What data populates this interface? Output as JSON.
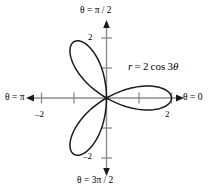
{
  "figure": {
    "background_color": "#ffffff",
    "curve_color": "#1a1a1a",
    "axis_color": "#8c8c8c",
    "text_color": "#000000"
  },
  "labels": {
    "theta_pi_over_2": "θ = π / 2",
    "theta_3pi_over_2": "θ = 3π / 2",
    "theta_pi": "θ = π",
    "theta_0": "θ = 0",
    "equation": "r = 2 cos 3θ",
    "equation_parts": {
      "r": "r",
      "equals": "=",
      "coefficient": "2",
      "function": "cos",
      "multiple": "3",
      "theta": "θ"
    }
  },
  "ticks": {
    "x_neg2": "–2",
    "x_pos2": "2",
    "y_pos2": "2",
    "y_neg2": "–2"
  },
  "chart_data": {
    "type": "line",
    "plot_kind": "polar-rose",
    "title": "",
    "equation": "r = 2 cos 3θ",
    "xlabel": "θ = 0",
    "ylabel": "θ = π / 2",
    "xlim": [
      -2.6,
      2.6
    ],
    "ylim": [
      -2.6,
      2.6
    ],
    "xticks": [
      -2,
      -1,
      1,
      2
    ],
    "yticks": [
      -2,
      -1,
      1,
      2
    ],
    "xtick_labels": [
      "–2",
      "",
      "",
      "2"
    ],
    "ytick_labels": [
      "–2",
      "",
      "",
      "2"
    ],
    "grid": false,
    "legend": false,
    "axis_arrows": [
      "left",
      "right",
      "up",
      "down"
    ],
    "angle_labels": [
      {
        "angle_deg": 0,
        "text": "θ = 0",
        "position": "right"
      },
      {
        "angle_deg": 90,
        "text": "θ = π / 2",
        "position": "top"
      },
      {
        "angle_deg": 180,
        "text": "θ = π",
        "position": "left"
      },
      {
        "angle_deg": 270,
        "text": "θ = 3π / 2",
        "position": "bottom"
      }
    ],
    "polar": {
      "r_function": "2*cos(3*theta)",
      "amplitude": 2,
      "petal_count": 3,
      "max_radius": 2,
      "petal_axis_angles_deg": [
        0,
        120,
        240
      ],
      "petal_half_width_deg": 30,
      "theta_range_deg": [
        0,
        360
      ],
      "sample_step_deg": 1
    },
    "series": [
      {
        "name": "r = 2 cos 3θ",
        "color": "#1a1a1a",
        "points_polar_deg": [
          {
            "theta": 0,
            "r": 2.0
          },
          {
            "theta": 10,
            "r": 1.732
          },
          {
            "theta": 20,
            "r": 1.0
          },
          {
            "theta": 30,
            "r": 0.0
          },
          {
            "theta": 40,
            "r": -1.0
          },
          {
            "theta": 50,
            "r": -1.732
          },
          {
            "theta": 60,
            "r": -2.0
          },
          {
            "theta": 70,
            "r": -1.732
          },
          {
            "theta": 80,
            "r": -1.0
          },
          {
            "theta": 90,
            "r": 0.0
          },
          {
            "theta": 100,
            "r": 1.0
          },
          {
            "theta": 110,
            "r": 1.732
          },
          {
            "theta": 120,
            "r": 2.0
          },
          {
            "theta": 130,
            "r": 1.732
          },
          {
            "theta": 140,
            "r": 1.0
          },
          {
            "theta": 150,
            "r": 0.0
          },
          {
            "theta": 160,
            "r": -1.0
          },
          {
            "theta": 170,
            "r": -1.732
          },
          {
            "theta": 180,
            "r": -2.0
          },
          {
            "theta": 190,
            "r": -1.732
          },
          {
            "theta": 200,
            "r": -1.0
          },
          {
            "theta": 210,
            "r": 0.0
          },
          {
            "theta": 220,
            "r": 1.0
          },
          {
            "theta": 230,
            "r": 1.732
          },
          {
            "theta": 240,
            "r": 2.0
          },
          {
            "theta": 250,
            "r": 1.732
          },
          {
            "theta": 260,
            "r": 1.0
          },
          {
            "theta": 270,
            "r": 0.0
          },
          {
            "theta": 280,
            "r": -1.0
          },
          {
            "theta": 290,
            "r": -1.732
          },
          {
            "theta": 300,
            "r": -2.0
          },
          {
            "theta": 310,
            "r": -1.732
          },
          {
            "theta": 320,
            "r": -1.0
          },
          {
            "theta": 330,
            "r": 0.0
          },
          {
            "theta": 340,
            "r": 1.0
          },
          {
            "theta": 350,
            "r": 1.732
          },
          {
            "theta": 360,
            "r": 2.0
          }
        ]
      }
    ]
  }
}
